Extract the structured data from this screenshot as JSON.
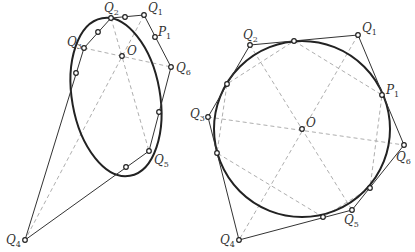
{
  "figures": [
    {
      "name": "ellipse-figure",
      "center_label": "O",
      "labels": {
        "Q1": {
          "text": "Q",
          "sub": "1"
        },
        "Q2": {
          "text": "Q",
          "sub": "2"
        },
        "Q3": {
          "text": "Q",
          "sub": "3"
        },
        "Q4": {
          "text": "Q",
          "sub": "4"
        },
        "Q5": {
          "text": "Q",
          "sub": "5"
        },
        "Q6": {
          "text": "Q",
          "sub": "6"
        },
        "P1": {
          "text": "P",
          "sub": "1"
        },
        "O": {
          "text": "O"
        }
      }
    },
    {
      "name": "circle-figure",
      "center_label": "O",
      "labels": {
        "Q1": {
          "text": "Q",
          "sub": "1"
        },
        "Q2": {
          "text": "Q",
          "sub": "2"
        },
        "Q3": {
          "text": "Q",
          "sub": "3"
        },
        "Q4": {
          "text": "Q",
          "sub": "4"
        },
        "Q5": {
          "text": "Q",
          "sub": "5"
        },
        "Q6": {
          "text": "Q",
          "sub": "6"
        },
        "P1": {
          "text": "P",
          "sub": "1"
        },
        "O": {
          "text": "O"
        }
      }
    }
  ],
  "colors": {
    "curve": "#222222",
    "polygon": "#333333",
    "dashed": "#999999"
  }
}
